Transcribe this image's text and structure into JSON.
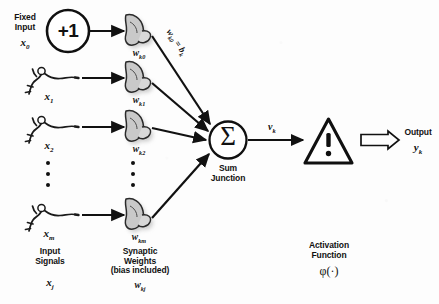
{
  "diagram": {
    "background_color": "#fdfdfd",
    "ink_color": "#111111",
    "shadow_color": "#b9b9b9"
  },
  "fixed_input": {
    "caption_line1": "Fixed",
    "caption_line2": "Input",
    "symbol": "x",
    "symbol_sub": "0",
    "node_value": "+1"
  },
  "inputs": [
    {
      "symbol": "x",
      "symbol_sub": "1",
      "icon": "neuron-sketch-icon"
    },
    {
      "symbol": "x",
      "symbol_sub": "2",
      "icon": "neuron-sketch-icon"
    },
    {
      "symbol": "x",
      "symbol_sub": "m",
      "icon": "neuron-sketch-icon"
    }
  ],
  "weights": [
    {
      "symbol": "w",
      "symbol_sub": "k0",
      "icon": "synapse-icon"
    },
    {
      "symbol": "w",
      "symbol_sub": "k1",
      "icon": "synapse-icon"
    },
    {
      "symbol": "w",
      "symbol_sub": "k2",
      "icon": "synapse-icon"
    },
    {
      "symbol": "w",
      "symbol_sub": "km",
      "icon": "synapse-icon"
    }
  ],
  "bias_annotation": {
    "text_prefix": "w",
    "text_prefix_sub": "k0",
    "equals": " = ",
    "text_suffix": "b",
    "text_suffix_sub": "k",
    "full": "wk0 = bk"
  },
  "sum_junction": {
    "glyph": "Σ",
    "caption_line1": "Sum",
    "caption_line2": "Junction"
  },
  "induced_field": {
    "symbol": "v",
    "symbol_sub": "k"
  },
  "activation": {
    "glyph": "!",
    "icon": "warning-triangle-icon",
    "caption_line1": "Activation",
    "caption_line2": "Function",
    "symbol": "φ(·)"
  },
  "output": {
    "caption": "Output",
    "symbol": "y",
    "symbol_sub": "k"
  },
  "legends": {
    "input_signals_line1": "Input",
    "input_signals_line2": "Signals",
    "input_signals_symbol": "x",
    "input_signals_symbol_sub": "j",
    "synaptic_weights_line1": "Synaptic",
    "synaptic_weights_line2": "Weights",
    "synaptic_weights_line3": "(bias included)",
    "synaptic_weights_symbol": "w",
    "synaptic_weights_symbol_sub": "kj"
  },
  "ellipsis": {
    "input_column_dots": 3,
    "weight_column_dots": 3
  }
}
